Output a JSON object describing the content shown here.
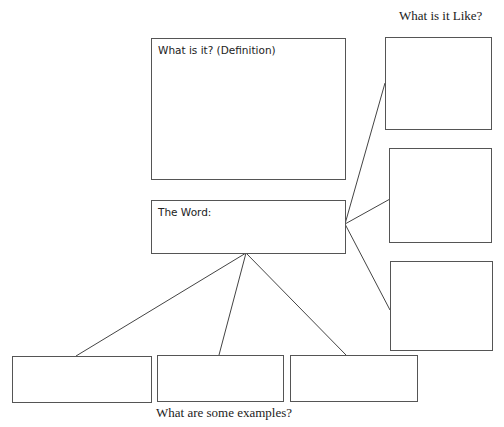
{
  "diagram": {
    "type": "word-map graphic organizer",
    "captions": {
      "like": "What is it Like?",
      "examples": "What are some examples?"
    },
    "boxes": {
      "definition": {
        "label": "What is it?  (Definition)"
      },
      "word": {
        "label": "The Word:"
      },
      "like": [
        {
          "label": ""
        },
        {
          "label": ""
        },
        {
          "label": ""
        }
      ],
      "examples": [
        {
          "label": ""
        },
        {
          "label": ""
        },
        {
          "label": ""
        }
      ]
    },
    "connections": [
      {
        "from": "word",
        "to": "like-1"
      },
      {
        "from": "word",
        "to": "like-2"
      },
      {
        "from": "word",
        "to": "like-3"
      },
      {
        "from": "word",
        "to": "example-1"
      },
      {
        "from": "word",
        "to": "example-2"
      },
      {
        "from": "word",
        "to": "example-3"
      }
    ]
  }
}
